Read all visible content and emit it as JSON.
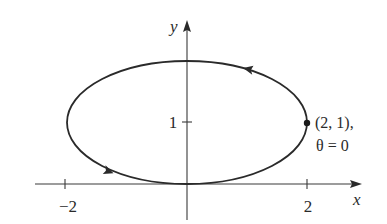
{
  "diagram": {
    "type": "parametric-curve",
    "colors": {
      "ink": "#2a2a2a",
      "axis": "#3a3a3a",
      "background": "#ffffff"
    },
    "axes": {
      "x_label": "x",
      "y_label": "y",
      "x_ticks": [
        {
          "value": -2,
          "label": "−2"
        },
        {
          "value": 2,
          "label": "2"
        }
      ],
      "y_ticks": [
        {
          "value": 1,
          "label": "1"
        }
      ]
    },
    "curve": {
      "shape": "ellipse",
      "center": [
        0,
        1
      ],
      "semi_axis_x": 2,
      "semi_axis_y": 1,
      "direction": "counterclockwise",
      "arrows": [
        "upper-right arc pointing left",
        "lower-left arc pointing right"
      ]
    },
    "marked_point": {
      "coords_label": "(2, 1),",
      "param_label": "θ = 0"
    }
  }
}
